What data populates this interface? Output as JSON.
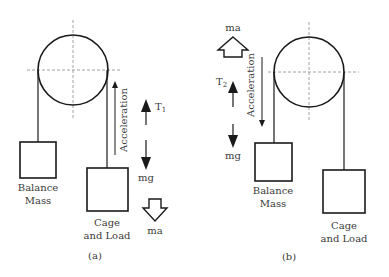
{
  "panels": [
    {
      "id": "a",
      "caption": "(a)",
      "balance_mass": {
        "line1": "Balance",
        "line2": "Mass"
      },
      "cage": {
        "line1": "Cage",
        "line2": "and Load"
      },
      "acceleration_label": "Acceleration",
      "acceleration_direction": "up",
      "tension_label": "T",
      "tension_subscript": "1",
      "weight_label": "mg",
      "inertial_label": "ma",
      "inertial_direction": "down"
    },
    {
      "id": "b",
      "caption": "(b)",
      "balance_mass": {
        "line1": "Balance",
        "line2": "Mass"
      },
      "cage": {
        "line1": "Cage",
        "line2": "and Load"
      },
      "acceleration_label": "Acceleration",
      "acceleration_direction": "down",
      "tension_label": "T",
      "tension_subscript": "2",
      "weight_label": "mg",
      "inertial_label": "ma",
      "inertial_direction": "up"
    }
  ],
  "colors": {
    "stroke": "#1a1a1a",
    "dash": "#8a8a8a",
    "text": "#3a3a3a"
  }
}
